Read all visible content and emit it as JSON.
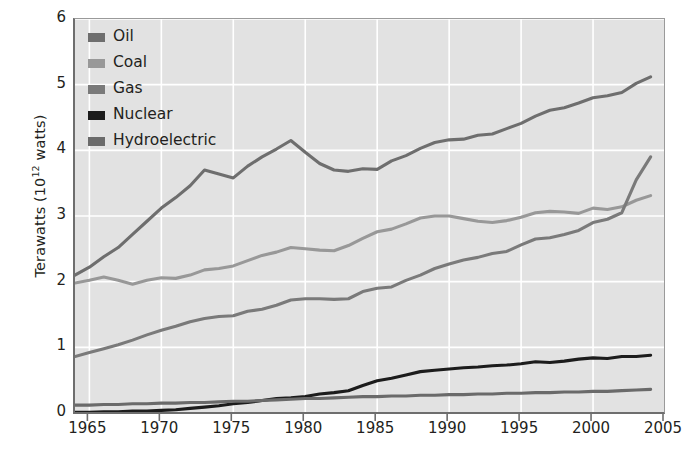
{
  "chart_data": {
    "type": "line",
    "title": "",
    "subtitle": "",
    "xlabel": "",
    "ylabel": "Terawatts (10^12 watts)",
    "ylabel_base": "Terawatts (10",
    "ylabel_exp": "12",
    "ylabel_tail": " watts)",
    "xlim": [
      1964,
      2005
    ],
    "ylim": [
      0,
      6
    ],
    "grid": true,
    "grid_color": "#ffffff",
    "plot_background": "#e2e2e2",
    "legend_position": "top-left",
    "xticks": [
      1965,
      1970,
      1975,
      1980,
      1985,
      1990,
      1995,
      2000,
      2005
    ],
    "yticks": [
      0,
      1,
      2,
      3,
      4,
      5,
      6
    ],
    "x": [
      1964,
      1965,
      1966,
      1967,
      1968,
      1969,
      1970,
      1971,
      1972,
      1973,
      1974,
      1975,
      1976,
      1977,
      1978,
      1979,
      1980,
      1981,
      1982,
      1983,
      1984,
      1985,
      1986,
      1987,
      1988,
      1989,
      1990,
      1991,
      1992,
      1993,
      1994,
      1995,
      1996,
      1997,
      1998,
      1999,
      2000,
      2001,
      2002,
      2003,
      2004
    ],
    "series": [
      {
        "name": "Oil",
        "color": "#6e6e6e",
        "values": [
          2.1,
          2.22,
          2.38,
          2.52,
          2.72,
          2.92,
          3.12,
          3.28,
          3.46,
          3.7,
          3.64,
          3.58,
          3.76,
          3.9,
          4.02,
          4.15,
          3.97,
          3.8,
          3.7,
          3.68,
          3.72,
          3.71,
          3.84,
          3.92,
          4.03,
          4.12,
          4.16,
          4.17,
          4.23,
          4.25,
          4.33,
          4.41,
          4.52,
          4.61,
          4.65,
          4.72,
          4.8,
          4.83,
          4.88,
          5.02,
          5.12
        ]
      },
      {
        "name": "Coal",
        "color": "#989898",
        "values": [
          1.98,
          2.02,
          2.07,
          2.02,
          1.96,
          2.02,
          2.06,
          2.05,
          2.1,
          2.18,
          2.2,
          2.24,
          2.32,
          2.4,
          2.45,
          2.52,
          2.5,
          2.48,
          2.47,
          2.55,
          2.66,
          2.76,
          2.8,
          2.88,
          2.97,
          3.0,
          3.0,
          2.96,
          2.92,
          2.9,
          2.93,
          2.98,
          3.05,
          3.07,
          3.06,
          3.04,
          3.12,
          3.1,
          3.14,
          3.24,
          3.31
        ]
      },
      {
        "name": "Gas",
        "color": "#7a7a7a",
        "values": [
          0.86,
          0.92,
          0.98,
          1.04,
          1.11,
          1.19,
          1.26,
          1.32,
          1.39,
          1.44,
          1.47,
          1.48,
          1.55,
          1.58,
          1.64,
          1.72,
          1.74,
          1.74,
          1.73,
          1.74,
          1.85,
          1.9,
          1.92,
          2.02,
          2.1,
          2.2,
          2.27,
          2.33,
          2.37,
          2.43,
          2.46,
          2.56,
          2.65,
          2.67,
          2.72,
          2.78,
          2.9,
          2.95,
          3.05,
          3.55,
          3.9
        ]
      },
      {
        "name": "Nuclear",
        "color": "#1c1c1c",
        "values": [
          0.01,
          0.01,
          0.02,
          0.02,
          0.03,
          0.03,
          0.04,
          0.05,
          0.07,
          0.09,
          0.11,
          0.14,
          0.16,
          0.19,
          0.22,
          0.23,
          0.25,
          0.29,
          0.31,
          0.34,
          0.42,
          0.49,
          0.53,
          0.58,
          0.63,
          0.65,
          0.67,
          0.69,
          0.7,
          0.72,
          0.73,
          0.75,
          0.78,
          0.77,
          0.79,
          0.82,
          0.84,
          0.83,
          0.86,
          0.86,
          0.88
        ]
      },
      {
        "name": "Hydroelectric",
        "color": "#6a6a6a",
        "values": [
          0.12,
          0.12,
          0.13,
          0.13,
          0.14,
          0.14,
          0.15,
          0.15,
          0.16,
          0.16,
          0.17,
          0.18,
          0.18,
          0.19,
          0.2,
          0.21,
          0.22,
          0.22,
          0.23,
          0.24,
          0.25,
          0.25,
          0.26,
          0.26,
          0.27,
          0.27,
          0.28,
          0.28,
          0.29,
          0.29,
          0.3,
          0.3,
          0.31,
          0.31,
          0.32,
          0.32,
          0.33,
          0.33,
          0.34,
          0.35,
          0.36
        ]
      }
    ]
  },
  "legend": {
    "items": [
      {
        "label": "Oil",
        "color": "#6e6e6e"
      },
      {
        "label": "Coal",
        "color": "#989898"
      },
      {
        "label": "Gas",
        "color": "#7a7a7a"
      },
      {
        "label": "Nuclear",
        "color": "#1c1c1c"
      },
      {
        "label": "Hydroelectric",
        "color": "#6a6a6a"
      }
    ]
  },
  "axes": {
    "y_tick_labels": [
      "6",
      "5",
      "4",
      "3",
      "2",
      "1",
      "0"
    ],
    "x_tick_labels": [
      "1965",
      "1970",
      "1975",
      "1980",
      "1985",
      "1990",
      "1995",
      "2000",
      "2005"
    ]
  }
}
